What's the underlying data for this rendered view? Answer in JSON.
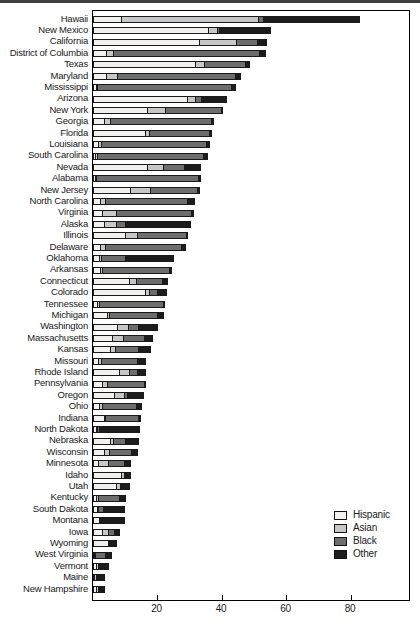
{
  "figure": {
    "x_axis": {
      "ticks": [
        20,
        40,
        60,
        80
      ],
      "max": 98
    },
    "layout": {
      "plot_left": 92,
      "plot_top": 10,
      "plot_inner_width": 316,
      "row_spacing": 11.4,
      "bar_height": 7,
      "first_bar_offset": 4.8
    }
  },
  "chart_data": {
    "type": "bar",
    "orientation": "horizontal",
    "stacked": true,
    "title": "",
    "xlabel": "",
    "ylabel": "",
    "xlim": [
      0,
      98
    ],
    "xticks": [
      20,
      40,
      60,
      80
    ],
    "grid": false,
    "legend_position": "bottom-right",
    "categories": [
      "Hawaii",
      "New Mexico",
      "California",
      "District of Columbia",
      "Texas",
      "Maryland",
      "Mississippi",
      "Arizona",
      "New York",
      "Georgia",
      "Florida",
      "Louisiana",
      "South Carolina",
      "Nevada",
      "Alabama",
      "New Jersey",
      "North Carolina",
      "Virginia",
      "Alaska",
      "Illinois",
      "Delaware",
      "Oklahoma",
      "Arkansas",
      "Connecticut",
      "Colorado",
      "Tennessee",
      "Michigan",
      "Washington",
      "Massachusetts",
      "Kansas",
      "Missouri",
      "Rhode Island",
      "Pennsylvania",
      "Oregon",
      "Ohio",
      "Indiana",
      "North Dakota",
      "Nebraska",
      "Wisconsin",
      "Minnesota",
      "Idaho",
      "Utah",
      "Kentucky",
      "South Dakota",
      "Montana",
      "Iowa",
      "Wyoming",
      "West Virginia",
      "Vermont",
      "Maine",
      "New Hampshire"
    ],
    "series": [
      {
        "name": "Hispanic",
        "color": "#f2f1ef",
        "values": [
          9.0,
          36.0,
          33.1,
          4.3,
          32.0,
          4.3,
          1.1,
          29.3,
          17.1,
          3.6,
          16.4,
          1.9,
          1.0,
          17.1,
          0.8,
          11.9,
          2.4,
          3.2,
          3.6,
          10.2,
          2.4,
          2.2,
          2.4,
          11.5,
          16.4,
          1.6,
          4.5,
          7.6,
          6.3,
          5.7,
          1.9,
          8.5,
          3.2,
          6.7,
          2.2,
          3.6,
          1.2,
          5.5,
          3.6,
          1.9,
          9.1,
          7.4,
          1.3,
          1.5,
          2.2,
          3.2,
          5.0,
          0.5,
          1.1,
          0.7,
          1.3
        ]
      },
      {
        "name": "Asian",
        "color": "#c7c7c7",
        "values": [
          42.8,
          3.0,
          12.0,
          2.4,
          3.0,
          3.8,
          0.6,
          2.9,
          5.8,
          2.2,
          1.5,
          1.3,
          0.9,
          5.2,
          0.7,
          6.5,
          1.9,
          4.7,
          4.3,
          4.1,
          2.1,
          1.0,
          0.9,
          2.6,
          1.5,
          1.0,
          1.0,
          3.9,
          3.5,
          1.7,
          1.3,
          3.3,
          1.7,
          3.5,
          1.3,
          0.9,
          0.6,
          1.4,
          1.9,
          3.4,
          1.1,
          1.7,
          0.9,
          0.8,
          0.5,
          2.1,
          0.6,
          0.5,
          1.0,
          0.7,
          1.0
        ]
      },
      {
        "name": "Black",
        "color": "#6d6d6d",
        "values": [
          1.8,
          1.0,
          6.8,
          45.8,
          13.0,
          37.0,
          42.1,
          2.3,
          17.6,
          31.8,
          18.9,
          32.8,
          33.1,
          7.0,
          32.0,
          14.8,
          25.8,
          23.5,
          3.1,
          15.5,
          23.6,
          7.8,
          21.1,
          8.2,
          2.9,
          20.0,
          15.3,
          3.5,
          6.9,
          7.4,
          11.4,
          2.7,
          11.8,
          1.2,
          10.8,
          10.3,
          1.1,
          4.1,
          7.2,
          5.2,
          0.4,
          0.6,
          6.9,
          1.7,
          0.4,
          2.1,
          0.7,
          3.5,
          0.5,
          0.7,
          0.4
        ]
      },
      {
        "name": "Other",
        "color": "#1c1c1c",
        "values": [
          30.2,
          16.2,
          3.1,
          2.2,
          1.5,
          1.6,
          1.4,
          8.0,
          0.7,
          1.0,
          1.0,
          1.1,
          1.5,
          5.2,
          0.8,
          0.8,
          2.5,
          0.9,
          20.4,
          0.7,
          1.7,
          15.2,
          1.1,
          1.8,
          3.1,
          0.8,
          2.3,
          6.2,
          2.8,
          4.0,
          2.8,
          2.8,
          0.5,
          5.3,
          1.7,
          1.0,
          12.5,
          4.3,
          2.1,
          2.2,
          1.9,
          2.6,
          2.1,
          7.0,
          7.4,
          2.0,
          2.1,
          2.2,
          3.1,
          2.4,
          1.7
        ]
      }
    ]
  }
}
